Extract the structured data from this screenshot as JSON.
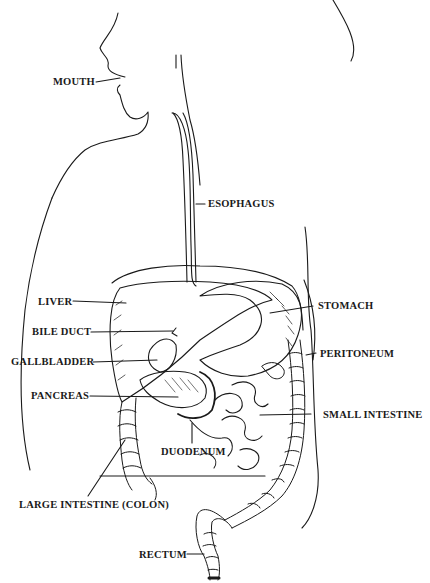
{
  "diagram": {
    "line_color": "#1a1a1a",
    "background": "#ffffff",
    "labels": [
      {
        "id": "mouth",
        "text": "MOUTH",
        "x": 53,
        "y": 79
      },
      {
        "id": "esophagus",
        "text": "ESOPHAGUS",
        "x": 208,
        "y": 199
      },
      {
        "id": "liver",
        "text": "LIVER",
        "x": 38,
        "y": 297
      },
      {
        "id": "stomach",
        "text": "STOMACH",
        "x": 318,
        "y": 300
      },
      {
        "id": "bile-duct",
        "text": "BILE DUCT",
        "x": 32,
        "y": 327
      },
      {
        "id": "peritoneum",
        "text": "PERITONEUM",
        "x": 320,
        "y": 348
      },
      {
        "id": "gallbladder",
        "text": "GALLBLADDER",
        "x": 11,
        "y": 357
      },
      {
        "id": "pancreas",
        "text": "PANCREAS",
        "x": 31,
        "y": 389
      },
      {
        "id": "small-intestine",
        "text": "SMALL INTESTINE",
        "x": 323,
        "y": 409
      },
      {
        "id": "duodenum",
        "text": "DUODENUM",
        "x": 161,
        "y": 446
      },
      {
        "id": "large-intestine",
        "text": "LARGE INTESTINE (COLON)",
        "x": 19,
        "y": 499
      },
      {
        "id": "rectum",
        "text": "RECTUM",
        "x": 139,
        "y": 548
      }
    ]
  }
}
